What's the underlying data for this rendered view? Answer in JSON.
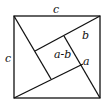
{
  "diagram": {
    "labels": {
      "top": "c",
      "left": "c",
      "center": "a-b",
      "b": "b",
      "a": "a"
    },
    "colors": {
      "stroke": "#111111",
      "background": "#ffffff"
    }
  }
}
